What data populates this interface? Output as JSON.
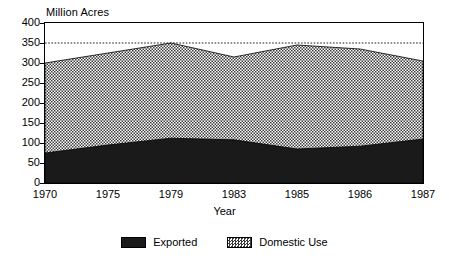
{
  "chart_data": {
    "type": "area",
    "stacked": true,
    "title": "",
    "ylabel": "Million Acres",
    "xlabel": "Year",
    "categories": [
      "1970",
      "1975",
      "1979",
      "1983",
      "1985",
      "1986",
      "1987"
    ],
    "series": [
      {
        "name": "Exported",
        "values": [
          75,
          95,
          112,
          108,
          85,
          92,
          110
        ],
        "fill": "solid-black",
        "color": "#1a1a1a"
      },
      {
        "name": "Domestic Use",
        "values": [
          225,
          230,
          238,
          207,
          260,
          243,
          195
        ],
        "fill": "hatched",
        "color": "#bfbfbf"
      }
    ],
    "totals": [
      300,
      325,
      350,
      315,
      345,
      335,
      305
    ],
    "ylim": [
      0,
      400
    ],
    "yticks": [
      0,
      50,
      100,
      150,
      200,
      250,
      300,
      350,
      400
    ],
    "ytick_labels": [
      "0",
      "50",
      "100",
      "150",
      "200",
      "250",
      "300",
      "350",
      "400"
    ],
    "grid": false,
    "reference_line": {
      "value": 350,
      "style": "dotted"
    },
    "legend_position": "bottom",
    "legend": [
      "Exported",
      "Domestic Use"
    ]
  },
  "axes": {
    "y_title": "Million Acres",
    "x_title": "Year"
  },
  "legend": {
    "items": [
      {
        "label": "Exported",
        "swatch": "solid-black-swatch"
      },
      {
        "label": "Domestic Use",
        "swatch": "hatched-swatch"
      }
    ]
  }
}
